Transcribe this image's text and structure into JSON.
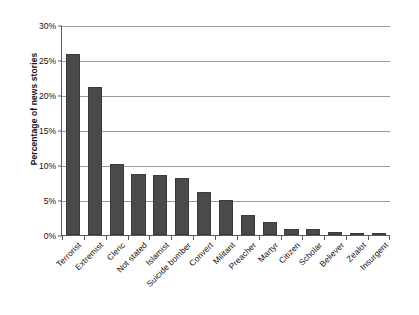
{
  "chart_data": {
    "type": "bar",
    "title": "",
    "subtitle": "",
    "xlabel": "",
    "ylabel": "Percentage of news stories",
    "ylim": [
      0,
      30
    ],
    "ytick_labels": [
      "0%",
      "5%",
      "10%",
      "15%",
      "20%",
      "25%",
      "30%"
    ],
    "ytick_values": [
      0,
      5,
      10,
      15,
      20,
      25,
      30
    ],
    "grid": "horizontal",
    "legend": "none",
    "bar_color": "#4a4a4a",
    "categories": [
      "Terrorist",
      "Extremist",
      "Cleric",
      "Not stated",
      "Islamist",
      "Suicide bomber",
      "Convert",
      "Militant",
      "Preacher",
      "Martyr",
      "Citizen",
      "Scholar",
      "Believer",
      "Zealot",
      "Insurgent"
    ],
    "values": [
      25.8,
      21.1,
      10.1,
      8.7,
      8.6,
      8.2,
      6.1,
      5.0,
      2.8,
      1.8,
      0.9,
      0.8,
      0.4,
      0.3,
      0.1
    ],
    "value_unit": "%"
  }
}
